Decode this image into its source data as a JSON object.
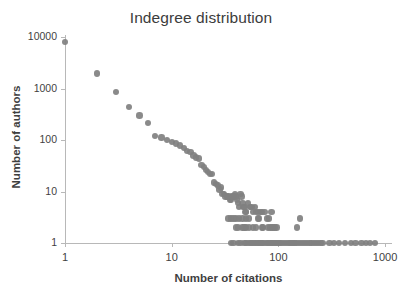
{
  "chart_data": {
    "type": "scatter",
    "title": "Indegree distribution",
    "xlabel": "Number of citations",
    "ylabel": "Number of authors",
    "xscale": "log",
    "yscale": "log",
    "xlim": [
      1,
      1000
    ],
    "ylim": [
      1,
      10000
    ],
    "xticks": [
      1,
      10,
      100,
      1000
    ],
    "xtick_labels": [
      "1",
      "10",
      "100",
      "1000"
    ],
    "yticks": [
      1,
      10,
      100,
      1000,
      10000
    ],
    "ytick_labels": [
      "1",
      "10",
      "100",
      "1000",
      "10000"
    ],
    "grid": false,
    "legend": false,
    "marker_color": "#808080",
    "marker_size": 6,
    "series": [
      {
        "name": "indegree",
        "points": [
          [
            1,
            8000
          ],
          [
            2,
            1950
          ],
          [
            3,
            850
          ],
          [
            4,
            440
          ],
          [
            5,
            300
          ],
          [
            6,
            215
          ],
          [
            7,
            120
          ],
          [
            8,
            112
          ],
          [
            9,
            100
          ],
          [
            10,
            92
          ],
          [
            11,
            86
          ],
          [
            12,
            78
          ],
          [
            13,
            70
          ],
          [
            14,
            62
          ],
          [
            15,
            58
          ],
          [
            16,
            50
          ],
          [
            17,
            46
          ],
          [
            18,
            44
          ],
          [
            19,
            33
          ],
          [
            20,
            30
          ],
          [
            21,
            26
          ],
          [
            22,
            24
          ],
          [
            23,
            22
          ],
          [
            24,
            22
          ],
          [
            25,
            15
          ],
          [
            26,
            14
          ],
          [
            27,
            13
          ],
          [
            28,
            11
          ],
          [
            29,
            12
          ],
          [
            30,
            9
          ],
          [
            31,
            9
          ],
          [
            32,
            8
          ],
          [
            33,
            8
          ],
          [
            34,
            8
          ],
          [
            35,
            7
          ],
          [
            36,
            7
          ],
          [
            37,
            8
          ],
          [
            38,
            8
          ],
          [
            39,
            9
          ],
          [
            40,
            8
          ],
          [
            41,
            7
          ],
          [
            42,
            6
          ],
          [
            43,
            5
          ],
          [
            44,
            9
          ],
          [
            45,
            8
          ],
          [
            46,
            6
          ],
          [
            47,
            5
          ],
          [
            48,
            5
          ],
          [
            49,
            4
          ],
          [
            50,
            4
          ],
          [
            52,
            6
          ],
          [
            54,
            5
          ],
          [
            56,
            5
          ],
          [
            58,
            4
          ],
          [
            60,
            5
          ],
          [
            62,
            4
          ],
          [
            64,
            4
          ],
          [
            66,
            3
          ],
          [
            68,
            4
          ],
          [
            70,
            4
          ],
          [
            74,
            4
          ],
          [
            78,
            3
          ],
          [
            34,
            3
          ],
          [
            36,
            3
          ],
          [
            38,
            3
          ],
          [
            40,
            3
          ],
          [
            43,
            3
          ],
          [
            46,
            3
          ],
          [
            50,
            3
          ],
          [
            53,
            3
          ],
          [
            58,
            2
          ],
          [
            62,
            2
          ],
          [
            64,
            3
          ],
          [
            82,
            3
          ],
          [
            86,
            4
          ],
          [
            150,
            2
          ],
          [
            160,
            3
          ],
          [
            40,
            2
          ],
          [
            42,
            2
          ],
          [
            46,
            2
          ],
          [
            48,
            2
          ],
          [
            50,
            2
          ],
          [
            53,
            2
          ],
          [
            70,
            2
          ],
          [
            72,
            2
          ],
          [
            80,
            2
          ],
          [
            84,
            2
          ],
          [
            88,
            2
          ],
          [
            92,
            2
          ],
          [
            96,
            2
          ],
          [
            36,
            1
          ],
          [
            38,
            1
          ],
          [
            42,
            1
          ],
          [
            44,
            1
          ],
          [
            48,
            1
          ],
          [
            50,
            1
          ],
          [
            52,
            1
          ],
          [
            54,
            1
          ],
          [
            56,
            1
          ],
          [
            58,
            1
          ],
          [
            60,
            1
          ],
          [
            62,
            1
          ],
          [
            64,
            1
          ],
          [
            66,
            1
          ],
          [
            68,
            1
          ],
          [
            70,
            1
          ],
          [
            72,
            1
          ],
          [
            75,
            1
          ],
          [
            78,
            1
          ],
          [
            81,
            1
          ],
          [
            84,
            1
          ],
          [
            87,
            1
          ],
          [
            90,
            1
          ],
          [
            94,
            1
          ],
          [
            98,
            1
          ],
          [
            102,
            1
          ],
          [
            106,
            1
          ],
          [
            110,
            1
          ],
          [
            115,
            1
          ],
          [
            120,
            1
          ],
          [
            125,
            1
          ],
          [
            130,
            1
          ],
          [
            136,
            1
          ],
          [
            142,
            1
          ],
          [
            148,
            1
          ],
          [
            155,
            1
          ],
          [
            162,
            1
          ],
          [
            170,
            1
          ],
          [
            178,
            1
          ],
          [
            186,
            1
          ],
          [
            195,
            1
          ],
          [
            205,
            1
          ],
          [
            215,
            1
          ],
          [
            225,
            1
          ],
          [
            236,
            1
          ],
          [
            248,
            1
          ],
          [
            260,
            1
          ],
          [
            300,
            1
          ],
          [
            330,
            1
          ],
          [
            370,
            1
          ],
          [
            420,
            1
          ],
          [
            480,
            1
          ],
          [
            530,
            1
          ],
          [
            600,
            1
          ],
          [
            660,
            1
          ],
          [
            720,
            1
          ],
          [
            800,
            1
          ]
        ]
      }
    ]
  }
}
